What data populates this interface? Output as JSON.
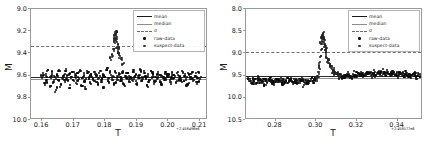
{
  "figure": {
    "background": "#ffffff",
    "width": 431,
    "height": 144
  },
  "legend_labels": {
    "mean": "mean",
    "median": "median",
    "sigma": "σ",
    "raw_data": "raw-data",
    "suspect_data": "suspect-data"
  },
  "panels": [
    {
      "id": "left-panel",
      "xlabel": "T",
      "ylabel": "M",
      "x_offset_text": "+2.458496e6",
      "xticks": [
        "0.16",
        "0.17",
        "0.18",
        "0.19",
        "0.20",
        "0.21"
      ],
      "xtick_values": [
        0.16,
        0.17,
        0.18,
        0.19,
        0.2,
        0.21
      ],
      "yticks": [
        "9.0",
        "9.2",
        "9.4",
        "9.6",
        "9.8",
        "10.0"
      ],
      "ytick_values": [
        9.0,
        9.2,
        9.4,
        9.6,
        9.8,
        10.0
      ],
      "xlim": [
        0.1565,
        0.2125
      ],
      "ylim": [
        10.0,
        9.0
      ],
      "y_inverted": true,
      "mean_value": 9.615,
      "median_value": 9.632,
      "sigma_value": 9.335
    },
    {
      "id": "right-panel",
      "xlabel": "T",
      "ylabel": "M",
      "x_offset_text": "+2.458577e6",
      "xticks": [
        "0.28",
        "0.30",
        "0.32",
        "0.34"
      ],
      "xtick_values": [
        0.28,
        0.3,
        0.32,
        0.34
      ],
      "yticks": [
        "8.0",
        "8.5",
        "9.0",
        "9.5",
        "10.0",
        "10.5"
      ],
      "ytick_values": [
        8.0,
        8.5,
        9.0,
        9.5,
        10.0,
        10.5
      ],
      "xlim": [
        0.2655,
        0.3525
      ],
      "ylim": [
        10.5,
        8.0
      ],
      "y_inverted": true,
      "mean_value": 9.5,
      "median_value": 9.565,
      "sigma_value": 8.96
    }
  ],
  "chart_data": [
    {
      "type": "scatter",
      "id": "left-panel",
      "title": "",
      "xlabel": "T",
      "ylabel": "M",
      "x_offset": 2458496.0,
      "xlim": [
        0.1565,
        0.2125
      ],
      "ylim": [
        10.0,
        9.0
      ],
      "y_axis_inverted": true,
      "grid": false,
      "legend_position": "upper-right",
      "legend_entries": [
        "mean",
        "median",
        "σ",
        "raw-data",
        "suspect-data"
      ],
      "lines": [
        {
          "name": "mean",
          "type": "hline",
          "value": 9.615,
          "color": "#2b2b2b",
          "style": "solid"
        },
        {
          "name": "median",
          "type": "hline",
          "value": 9.632,
          "color": "#8f8f8f",
          "style": "solid"
        },
        {
          "name": "σ",
          "type": "hline",
          "value": 9.335,
          "color": "#707070",
          "style": "dashed"
        }
      ],
      "series": [
        {
          "name": "raw-data",
          "marker": "point",
          "color": "#0d0d0d",
          "x": [
            0.16,
            0.1604,
            0.1608,
            0.1612,
            0.1616,
            0.162,
            0.1624,
            0.1628,
            0.1632,
            0.1636,
            0.164,
            0.1644,
            0.1648,
            0.1652,
            0.1656,
            0.166,
            0.1664,
            0.1668,
            0.1672,
            0.1676,
            0.168,
            0.1684,
            0.1688,
            0.1692,
            0.1696,
            0.17,
            0.1704,
            0.1708,
            0.1712,
            0.1716,
            0.172,
            0.1724,
            0.1728,
            0.1732,
            0.1736,
            0.174,
            0.1744,
            0.1748,
            0.1752,
            0.1756,
            0.176,
            0.1764,
            0.1768,
            0.1772,
            0.1776,
            0.178,
            0.1784,
            0.1788,
            0.1792,
            0.1796,
            0.18,
            0.1804,
            0.1808,
            0.1812,
            0.1816,
            0.182,
            0.1824,
            0.1828,
            0.1832,
            0.1836,
            0.184,
            0.1844,
            0.1848,
            0.1852,
            0.1856,
            0.186,
            0.1864,
            0.1868,
            0.1872,
            0.1876,
            0.188,
            0.1884,
            0.1888,
            0.1892,
            0.1896,
            0.19,
            0.1904,
            0.1908,
            0.1912,
            0.1916,
            0.192,
            0.1924,
            0.1928,
            0.1932,
            0.1936,
            0.194,
            0.1944,
            0.1948,
            0.1952,
            0.1956,
            0.196,
            0.1964,
            0.1968,
            0.1972,
            0.1976,
            0.198,
            0.1984,
            0.1988,
            0.1992,
            0.1996,
            0.2,
            0.2004,
            0.2008,
            0.2012,
            0.2016,
            0.202,
            0.2024,
            0.2028,
            0.2032,
            0.2036,
            0.204,
            0.2044,
            0.2048,
            0.2052,
            0.2056,
            0.206,
            0.2064,
            0.2068,
            0.2072,
            0.2076,
            0.208,
            0.2084,
            0.2088,
            0.2092,
            0.2096,
            0.21
          ],
          "y": [
            9.62,
            9.58,
            9.67,
            9.6,
            9.64,
            9.55,
            9.7,
            9.62,
            9.57,
            9.66,
            9.61,
            9.73,
            9.59,
            9.64,
            9.56,
            9.68,
            9.62,
            9.6,
            9.66,
            9.54,
            9.63,
            9.59,
            9.71,
            9.61,
            9.57,
            9.65,
            9.6,
            9.67,
            9.58,
            9.63,
            9.55,
            9.69,
            9.62,
            9.6,
            9.64,
            9.72,
            9.58,
            9.61,
            9.66,
            9.59,
            9.63,
            9.57,
            9.65,
            9.6,
            9.68,
            9.62,
            9.56,
            9.64,
            9.59,
            9.7,
            9.61,
            9.55,
            9.63,
            9.66,
            9.58,
            9.62,
            9.6,
            9.67,
            9.57,
            9.64,
            9.61,
            9.59,
            9.65,
            9.63,
            9.56,
            9.68,
            9.6,
            9.62,
            9.58,
            9.66,
            9.61,
            9.64,
            9.57,
            9.63,
            9.59,
            9.67,
            9.6,
            9.62,
            9.55,
            9.65,
            9.63,
            9.58,
            9.61,
            9.69,
            9.6,
            9.64,
            9.56,
            9.62,
            9.59,
            9.66,
            9.61,
            9.63,
            9.57,
            9.65,
            9.6,
            9.68,
            9.62,
            9.58,
            9.64,
            9.61,
            9.59,
            9.66,
            9.63,
            9.57,
            9.62,
            9.6,
            9.67,
            9.58,
            9.64,
            9.61,
            9.63,
            9.56,
            9.65,
            9.6,
            9.62,
            9.68,
            9.59,
            9.63,
            9.61,
            9.57,
            9.64,
            9.6,
            9.66,
            9.62,
            9.58,
            9.63
          ]
        },
        {
          "name": "suspect-data",
          "marker": "point",
          "color": "#262626",
          "comment": "flare points near T=0.1835 rising above sigma threshold",
          "x": [
            0.1818,
            0.1822,
            0.1826,
            0.1828,
            0.183,
            0.1832,
            0.1833,
            0.1834,
            0.1835,
            0.1836,
            0.1837,
            0.1838,
            0.184,
            0.1842,
            0.1844,
            0.1846,
            0.185,
            0.1854
          ],
          "y": [
            9.46,
            9.41,
            9.36,
            9.3,
            9.26,
            9.23,
            9.21,
            9.22,
            9.24,
            9.27,
            9.3,
            9.34,
            9.38,
            9.4,
            9.36,
            9.42,
            9.45,
            9.5
          ]
        }
      ]
    },
    {
      "type": "scatter",
      "id": "right-panel",
      "title": "",
      "xlabel": "T",
      "ylabel": "M",
      "x_offset": 2458577.0,
      "xlim": [
        0.2655,
        0.3525
      ],
      "ylim": [
        10.5,
        8.0
      ],
      "y_axis_inverted": true,
      "grid": false,
      "legend_position": "upper-right",
      "legend_entries": [
        "mean",
        "median",
        "σ",
        "raw-data",
        "suspect-data"
      ],
      "lines": [
        {
          "name": "mean",
          "type": "hline",
          "value": 9.5,
          "color": "#2b2b2b",
          "style": "solid"
        },
        {
          "name": "median",
          "type": "hline",
          "value": 9.565,
          "color": "#8f8f8f",
          "style": "solid"
        },
        {
          "name": "σ",
          "type": "hline",
          "value": 8.96,
          "color": "#707070",
          "style": "dashed"
        }
      ],
      "series": [
        {
          "name": "raw-data",
          "marker": "point",
          "color": "#0d0d0d",
          "x": [
            0.267,
            0.2676,
            0.2682,
            0.2688,
            0.2694,
            0.27,
            0.2706,
            0.2712,
            0.2718,
            0.2724,
            0.273,
            0.2736,
            0.2742,
            0.2748,
            0.2754,
            0.276,
            0.2766,
            0.2772,
            0.2778,
            0.2784,
            0.279,
            0.2796,
            0.2802,
            0.2808,
            0.2814,
            0.282,
            0.2826,
            0.2832,
            0.2838,
            0.2844,
            0.285,
            0.2856,
            0.2862,
            0.2868,
            0.2874,
            0.288,
            0.2886,
            0.2892,
            0.2898,
            0.2904,
            0.291,
            0.2916,
            0.2922,
            0.2928,
            0.2934,
            0.294,
            0.2946,
            0.2952,
            0.2958,
            0.2964,
            0.297,
            0.2976,
            0.2982,
            0.2988,
            0.2994,
            0.3,
            0.312,
            0.3126,
            0.3132,
            0.3138,
            0.3144,
            0.315,
            0.3156,
            0.3162,
            0.3168,
            0.3174,
            0.318,
            0.3186,
            0.3192,
            0.3198,
            0.3204,
            0.321,
            0.3216,
            0.3222,
            0.3228,
            0.3234,
            0.324,
            0.3246,
            0.3252,
            0.3258,
            0.3264,
            0.327,
            0.3276,
            0.3282,
            0.3288,
            0.3294,
            0.33,
            0.3306,
            0.3312,
            0.3318,
            0.3324,
            0.333,
            0.3336,
            0.3342,
            0.3348,
            0.3354,
            0.336,
            0.3366,
            0.3372,
            0.3378,
            0.3384,
            0.339,
            0.3396,
            0.3402,
            0.3408,
            0.3414,
            0.342,
            0.3426,
            0.3432,
            0.3438,
            0.3444,
            0.345,
            0.3456,
            0.3462,
            0.3468,
            0.3474,
            0.348,
            0.3486,
            0.3492,
            0.3498,
            0.3504,
            0.351
          ],
          "y": [
            9.62,
            9.58,
            9.66,
            9.6,
            9.64,
            9.57,
            9.68,
            9.61,
            9.55,
            9.65,
            9.59,
            9.63,
            9.7,
            9.58,
            9.62,
            9.66,
            9.6,
            9.56,
            9.64,
            9.61,
            9.67,
            9.59,
            9.63,
            9.57,
            9.65,
            9.62,
            9.6,
            9.68,
            9.58,
            9.64,
            9.61,
            9.55,
            9.66,
            9.63,
            9.59,
            9.62,
            9.69,
            9.57,
            9.64,
            9.6,
            9.66,
            9.62,
            9.58,
            9.63,
            9.61,
            9.72,
            9.59,
            9.65,
            9.6,
            9.67,
            9.63,
            9.57,
            9.62,
            9.66,
            9.61,
            9.58,
            9.53,
            9.5,
            9.55,
            9.48,
            9.52,
            9.49,
            9.54,
            9.47,
            9.51,
            9.53,
            9.46,
            9.5,
            9.48,
            9.52,
            9.45,
            9.49,
            9.51,
            9.47,
            9.44,
            9.48,
            9.46,
            9.5,
            9.43,
            9.47,
            9.45,
            9.49,
            9.44,
            9.46,
            9.42,
            9.48,
            9.45,
            9.43,
            9.47,
            9.44,
            9.41,
            9.46,
            9.43,
            9.48,
            9.45,
            9.42,
            9.47,
            9.44,
            9.49,
            9.46,
            9.43,
            9.48,
            9.45,
            9.5,
            9.47,
            9.44,
            9.49,
            9.46,
            9.51,
            9.48,
            9.45,
            9.5,
            9.47,
            9.52,
            9.49,
            9.46,
            9.51,
            9.48,
            9.53,
            9.5,
            9.47,
            9.52
          ]
        },
        {
          "name": "suspect-data",
          "marker": "point",
          "color": "#262626",
          "comment": "sharp rise at T=0.301 then exponential decay back to baseline",
          "x": [
            0.3002,
            0.3006,
            0.301,
            0.3014,
            0.3018,
            0.3022,
            0.3024,
            0.3026,
            0.3028,
            0.303,
            0.3032,
            0.3034,
            0.3036,
            0.3038,
            0.304,
            0.3042,
            0.3044,
            0.3046,
            0.3048,
            0.305,
            0.3054,
            0.3058,
            0.3062,
            0.3066,
            0.307,
            0.3074,
            0.3078,
            0.3082,
            0.3086,
            0.309,
            0.3094,
            0.3098,
            0.3102,
            0.3106,
            0.311,
            0.3114,
            0.3118
          ],
          "y": [
            9.58,
            9.5,
            9.42,
            9.33,
            9.2,
            9.05,
            8.92,
            8.78,
            8.68,
            8.6,
            8.62,
            8.58,
            8.64,
            8.68,
            8.74,
            8.8,
            8.86,
            8.92,
            8.98,
            9.03,
            9.1,
            9.16,
            9.21,
            9.25,
            9.29,
            9.32,
            9.35,
            9.37,
            9.39,
            9.41,
            9.43,
            9.44,
            9.46,
            9.47,
            9.48,
            9.5,
            9.51
          ]
        }
      ]
    }
  ]
}
